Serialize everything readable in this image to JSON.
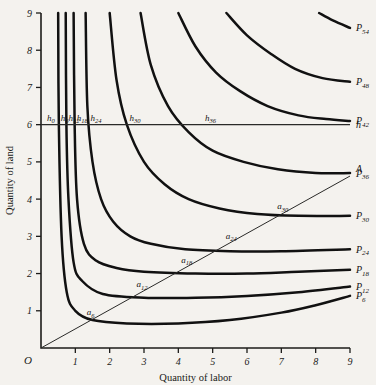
{
  "chart_data": {
    "type": "line",
    "title": "",
    "xlabel": "Quantity of labor",
    "ylabel": "Quantity of land",
    "xlim": [
      0,
      9
    ],
    "ylim": [
      0,
      9
    ],
    "xticks": [
      1,
      2,
      3,
      4,
      5,
      6,
      7,
      8,
      9
    ],
    "yticks": [
      1,
      2,
      3,
      4,
      5,
      6,
      7,
      8,
      9
    ],
    "grid": false,
    "origin_label": "O",
    "legend_position": "right-of-curve-ends",
    "series": [
      {
        "name": "P6",
        "label": "P_6",
        "end_label": "P",
        "end_sub": "6",
        "points": [
          [
            0.5,
            9.0
          ],
          [
            0.52,
            6.0
          ],
          [
            0.6,
            3.0
          ],
          [
            0.75,
            1.5
          ],
          [
            1.0,
            1.0
          ],
          [
            1.5,
            0.75
          ],
          [
            2.5,
            0.66
          ],
          [
            4.0,
            0.66
          ],
          [
            5.5,
            0.75
          ],
          [
            7.0,
            0.95
          ],
          [
            8.0,
            1.15
          ],
          [
            9.0,
            1.4
          ]
        ]
      },
      {
        "name": "P12",
        "label": "P_12",
        "end_label": "P",
        "end_sub": "12",
        "points": [
          [
            0.72,
            9.0
          ],
          [
            0.74,
            6.0
          ],
          [
            0.8,
            4.0
          ],
          [
            0.95,
            2.3
          ],
          [
            1.2,
            1.8
          ],
          [
            1.8,
            1.45
          ],
          [
            3.0,
            1.35
          ],
          [
            4.5,
            1.35
          ],
          [
            6.0,
            1.4
          ],
          [
            7.5,
            1.5
          ],
          [
            9.0,
            1.65
          ]
        ]
      },
      {
        "name": "P18",
        "label": "P_18",
        "end_label": "P",
        "end_sub": "18",
        "points": [
          [
            0.95,
            9.0
          ],
          [
            0.98,
            6.0
          ],
          [
            1.05,
            4.0
          ],
          [
            1.25,
            2.8
          ],
          [
            1.6,
            2.35
          ],
          [
            2.2,
            2.15
          ],
          [
            3.0,
            2.05
          ],
          [
            4.5,
            2.0
          ],
          [
            6.0,
            2.0
          ],
          [
            7.5,
            2.05
          ],
          [
            9.0,
            2.1
          ]
        ]
      },
      {
        "name": "P24",
        "label": "P_24",
        "end_label": "P",
        "end_sub": "24",
        "points": [
          [
            1.3,
            9.0
          ],
          [
            1.35,
            6.5
          ],
          [
            1.5,
            5.0
          ],
          [
            1.75,
            4.0
          ],
          [
            2.1,
            3.4
          ],
          [
            2.6,
            3.0
          ],
          [
            3.2,
            2.8
          ],
          [
            4.2,
            2.65
          ],
          [
            5.5,
            2.6
          ],
          [
            7.0,
            2.6
          ],
          [
            9.0,
            2.65
          ]
        ]
      },
      {
        "name": "P30",
        "label": "P_30",
        "end_label": "P",
        "end_sub": "30",
        "points": [
          [
            2.0,
            9.0
          ],
          [
            2.2,
            7.2
          ],
          [
            2.5,
            6.0
          ],
          [
            3.0,
            5.0
          ],
          [
            3.6,
            4.4
          ],
          [
            4.3,
            4.0
          ],
          [
            5.2,
            3.75
          ],
          [
            6.3,
            3.6
          ],
          [
            7.5,
            3.55
          ],
          [
            9.0,
            3.55
          ]
        ]
      },
      {
        "name": "P36",
        "label": "P_36",
        "end_label": "P",
        "end_sub": "36",
        "points": [
          [
            2.9,
            9.0
          ],
          [
            3.2,
            7.6
          ],
          [
            3.7,
            6.5
          ],
          [
            4.3,
            5.8
          ],
          [
            5.0,
            5.3
          ],
          [
            5.9,
            5.0
          ],
          [
            6.9,
            4.8
          ],
          [
            8.0,
            4.7
          ],
          [
            9.0,
            4.7
          ]
        ]
      },
      {
        "name": "P42",
        "label": "P_42",
        "end_label": "P",
        "end_sub": "42",
        "points": [
          [
            4.0,
            9.0
          ],
          [
            4.5,
            8.1
          ],
          [
            5.1,
            7.4
          ],
          [
            5.8,
            6.9
          ],
          [
            6.6,
            6.5
          ],
          [
            7.5,
            6.25
          ],
          [
            8.3,
            6.15
          ],
          [
            9.0,
            6.1
          ]
        ]
      },
      {
        "name": "P48",
        "label": "P_48",
        "end_label": "P",
        "end_sub": "48",
        "points": [
          [
            5.4,
            9.0
          ],
          [
            6.0,
            8.4
          ],
          [
            6.7,
            7.9
          ],
          [
            7.4,
            7.5
          ],
          [
            8.2,
            7.25
          ],
          [
            9.0,
            7.15
          ]
        ]
      },
      {
        "name": "P54",
        "label": "P_54",
        "end_label": "P",
        "end_sub": "54",
        "points": [
          [
            8.1,
            9.0
          ],
          [
            8.5,
            8.8
          ],
          [
            9.0,
            8.6
          ]
        ]
      }
    ],
    "h_line": {
      "label": "h",
      "y_value": 6,
      "x_from": 0,
      "x_to": 9,
      "points": [
        {
          "label": "h",
          "sub": "0",
          "x": 0.12,
          "y": 6
        },
        {
          "label": "h",
          "sub": "6",
          "x": 0.52,
          "y": 6
        },
        {
          "label": "h",
          "sub": "12",
          "x": 0.74,
          "y": 6
        },
        {
          "label": "h",
          "sub": "18",
          "x": 0.98,
          "y": 6
        },
        {
          "label": "h",
          "sub": "24",
          "x": 1.38,
          "y": 6
        },
        {
          "label": "h",
          "sub": "30",
          "x": 2.52,
          "y": 6
        },
        {
          "label": "h",
          "sub": "36",
          "x": 4.72,
          "y": 6
        }
      ]
    },
    "a_line": {
      "label": "A",
      "slope": 0.5,
      "from": [
        0,
        0
      ],
      "to": [
        9,
        4.62
      ],
      "points": [
        {
          "label": "a",
          "sub": "6",
          "x": 1.5,
          "y": 0.75
        },
        {
          "label": "a",
          "sub": "12",
          "x": 3.0,
          "y": 1.5
        },
        {
          "label": "a",
          "sub": "18",
          "x": 4.3,
          "y": 2.15
        },
        {
          "label": "a",
          "sub": "24",
          "x": 5.6,
          "y": 2.8
        },
        {
          "label": "a",
          "sub": "30",
          "x": 7.1,
          "y": 3.6
        }
      ]
    },
    "colors": {
      "background": "#f4f2ee",
      "ink": "#111111",
      "axis": "#1d1c1a"
    }
  }
}
